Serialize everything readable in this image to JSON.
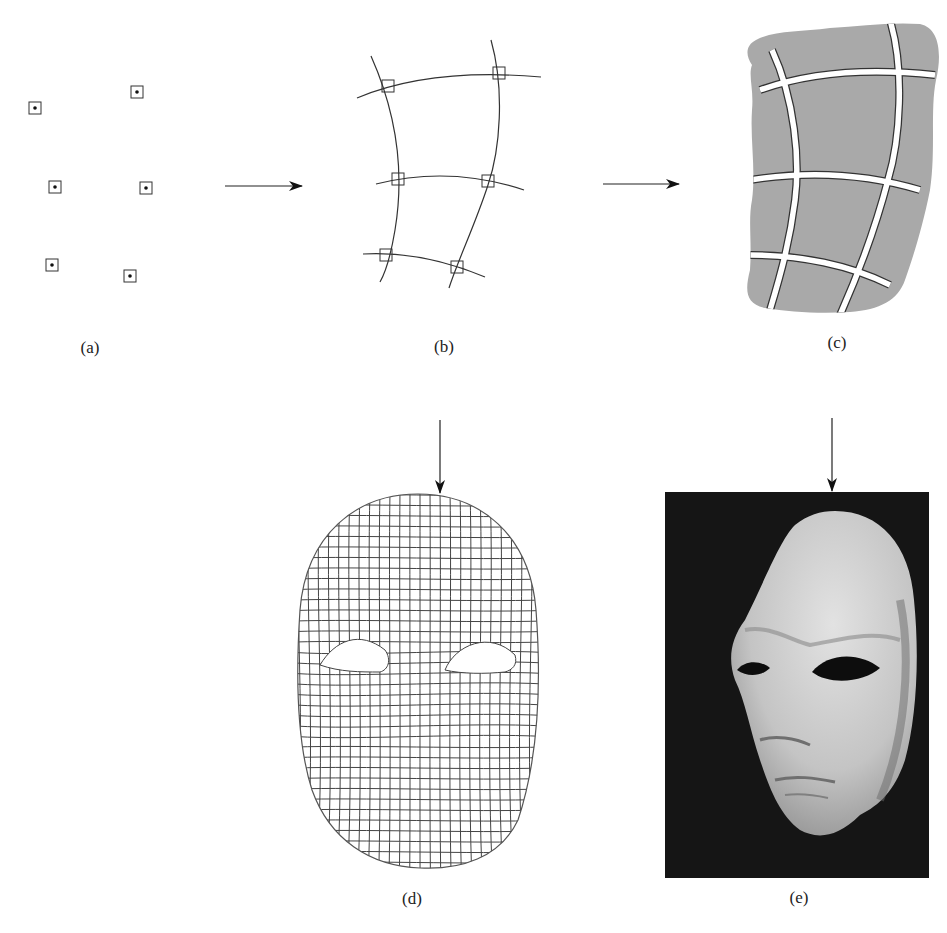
{
  "figure": {
    "panels": [
      {
        "id": "a",
        "label": "(a)",
        "description": "Sparse marker points (dots in squares)"
      },
      {
        "id": "b",
        "label": "(b)",
        "description": "Curves fitted through marker points forming a coarse grid"
      },
      {
        "id": "c",
        "label": "(c)",
        "description": "Surface patch divided into curved quadrilateral regions"
      },
      {
        "id": "d",
        "label": "(d)",
        "description": "Dense wireframe mesh of a face"
      },
      {
        "id": "e",
        "label": "(e)",
        "description": "Photograph of a rendered/physical face mask"
      }
    ],
    "arrows": [
      {
        "from": "a",
        "to": "b",
        "direction": "right"
      },
      {
        "from": "b",
        "to": "c",
        "direction": "right"
      },
      {
        "from": "c",
        "to": "d",
        "direction": "down"
      },
      {
        "from": "c",
        "to": "e",
        "direction": "down"
      }
    ],
    "colors": {
      "ink": "#222222",
      "patch_fill": "#a9a9a9",
      "photo_bg": "#141414",
      "mask_light": "#d6d6d6"
    }
  }
}
